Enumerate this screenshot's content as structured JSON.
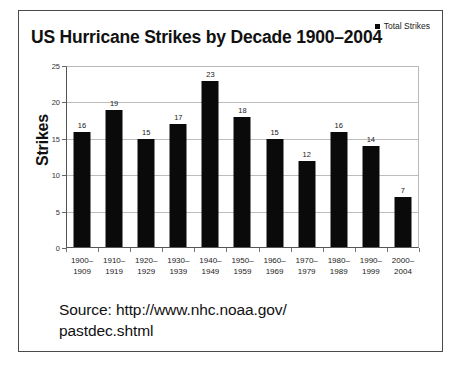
{
  "chart_data": {
    "type": "bar",
    "title": "US Hurricane Strikes by Decade 1900–2004",
    "xlabel": "",
    "ylabel": "Strikes",
    "categories": [
      "1900–\n1909",
      "1910–\n1919",
      "1920–\n1929",
      "1930–\n1939",
      "1940–\n1949",
      "1950–\n1959",
      "1960–\n1969",
      "1970–\n1979",
      "1980–\n1989",
      "1990–\n1999",
      "2000–\n2004"
    ],
    "category_lines": [
      [
        "1900–",
        "1909"
      ],
      [
        "1910–",
        "1919"
      ],
      [
        "1920–",
        "1929"
      ],
      [
        "1930–",
        "1939"
      ],
      [
        "1940–",
        "1949"
      ],
      [
        "1950–",
        "1959"
      ],
      [
        "1960–",
        "1969"
      ],
      [
        "1970–",
        "1979"
      ],
      [
        "1980–",
        "1989"
      ],
      [
        "1990–",
        "1999"
      ],
      [
        "2000–",
        "2004"
      ]
    ],
    "series": [
      {
        "name": "Total Strikes",
        "values": [
          16,
          19,
          15,
          17,
          23,
          18,
          15,
          12,
          16,
          14,
          7
        ],
        "color": "#0a0a0a"
      }
    ],
    "ylim": [
      0,
      25
    ],
    "yticks": [
      0,
      5,
      10,
      15,
      20,
      25
    ],
    "grid": true,
    "legend_position": "top-right",
    "bar_color": "#0a0a0a",
    "gridline_color": "#bdbdbd",
    "axis_color": "#555555"
  },
  "legend": {
    "label": "Total Strikes"
  },
  "caption": {
    "line1": "Source: http://www.nhc.noaa.gov/",
    "line2": "pastdec.shtml"
  }
}
